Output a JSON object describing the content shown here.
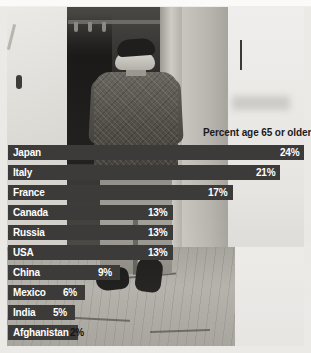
{
  "figure": {
    "note": "Percent age 65 or older",
    "photo_alt": "elderly-man-walking-street-photo"
  },
  "chart_data": {
    "type": "bar",
    "title": "Percent age 65 or older",
    "xlabel": "",
    "ylabel": "",
    "orientation": "horizontal",
    "grid": false,
    "legend": "none",
    "xlim": [
      0,
      25
    ],
    "unit": "%",
    "categories": [
      "Japan",
      "Italy",
      "France",
      "Canada",
      "Russia",
      "USA",
      "China",
      "Mexico",
      "India",
      "Afghanistan"
    ],
    "values": [
      24,
      21,
      17,
      13,
      13,
      13,
      9,
      6,
      5,
      2
    ],
    "labels": [
      "24%",
      "21%",
      "17%",
      "13%",
      "13%",
      "13%",
      "9%",
      "6%",
      "5%",
      "2%"
    ],
    "bar_color": "#3c3b39",
    "label_color": "#ffffff"
  },
  "rows": [
    {
      "name": "Japan",
      "value": "24%",
      "bar_w": 296,
      "label_pos": "inside",
      "val_x": 272,
      "top": 145
    },
    {
      "name": "Italy",
      "value": "21%",
      "bar_w": 272,
      "label_pos": "inside",
      "val_x": 248,
      "top": 165
    },
    {
      "name": "France",
      "value": "17%",
      "bar_w": 225,
      "label_pos": "inside",
      "val_x": 200,
      "top": 185
    },
    {
      "name": "Canada",
      "value": "13%",
      "bar_w": 165,
      "label_pos": "inside",
      "val_x": 140,
      "top": 205
    },
    {
      "name": "Russia",
      "value": "13%",
      "bar_w": 165,
      "label_pos": "inside",
      "val_x": 140,
      "top": 225
    },
    {
      "name": "USA",
      "value": "13%",
      "bar_w": 165,
      "label_pos": "inside",
      "val_x": 140,
      "top": 245
    },
    {
      "name": "China",
      "value": "9%",
      "bar_w": 112,
      "label_pos": "inside",
      "val_x": 90,
      "top": 265
    },
    {
      "name": "Mexico",
      "value": "6%",
      "bar_w": 77,
      "label_pos": "inside",
      "val_x": 55,
      "top": 285
    },
    {
      "name": "India",
      "value": "5%",
      "bar_w": 67,
      "label_pos": "inside",
      "val_x": 45,
      "top": 305
    },
    {
      "name": "Afghanistan",
      "value": "2%",
      "bar_w": 70,
      "label_pos": "outside",
      "val_x": 62,
      "top": 325
    }
  ]
}
